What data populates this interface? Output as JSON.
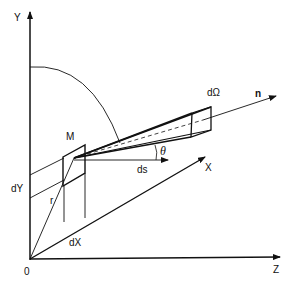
{
  "diagram": {
    "type": "3d-geometry-radiance",
    "axes": {
      "y_label": "Y",
      "z_label": "Z",
      "x_label": "X",
      "origin_label": "0"
    },
    "labels": {
      "plate": "M",
      "solid_angle": "dΩ",
      "normal": "n",
      "path_element": "ds",
      "angle": "θ",
      "position_vector": "r",
      "dy": "dY",
      "dx": "dX"
    },
    "colors": {
      "line": "#111111",
      "background": "#ffffff"
    }
  }
}
